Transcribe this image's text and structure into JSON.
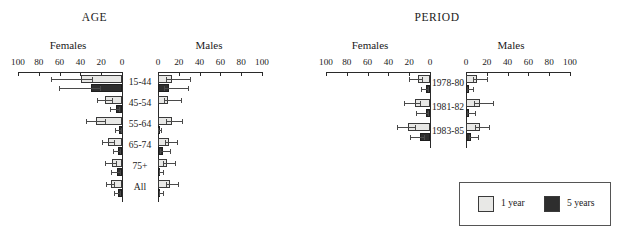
{
  "legend": {
    "entries": [
      {
        "label": "1 year",
        "color": "#e8e8e6",
        "key": "one_year"
      },
      {
        "label": "5 years",
        "color": "#2e2e2e",
        "key": "five_year"
      }
    ]
  },
  "axis": {
    "female_ticks": [
      "100",
      "80",
      "60",
      "40",
      "20",
      "0"
    ],
    "male_ticks": [
      "0",
      "20",
      "40",
      "60",
      "80",
      "100"
    ],
    "female_heading": "Females",
    "male_heading": "Males",
    "range": [
      0,
      100
    ]
  },
  "chart_data": [
    {
      "type": "bar",
      "title": "AGE",
      "xlabel": "",
      "ylabel": "",
      "xlim": [
        0,
        100
      ],
      "grid": false,
      "orientation": "horizontal-bidirectional",
      "legend_position": "outside-bottom-right",
      "categories": [
        "15-44",
        "45-54",
        "55-64",
        "65-74",
        "75+",
        "All"
      ],
      "panels": [
        {
          "name": "Females",
          "direction": "left",
          "series": [
            {
              "name": "1 year",
              "values": [
                39,
                16,
                25,
                13,
                10,
                11
              ],
              "ci_low": [
                29,
                10,
                16,
                8,
                6,
                8
              ],
              "ci_high": [
                68,
                24,
                35,
                19,
                16,
                15
              ]
            },
            {
              "name": "5 years",
              "values": [
                30,
                6,
                3,
                4,
                5,
                4
              ],
              "ci_low": [
                21,
                3,
                1,
                2,
                2,
                2
              ],
              "ci_high": [
                61,
                12,
                7,
                9,
                11,
                8
              ]
            }
          ]
        },
        {
          "name": "Males",
          "direction": "right",
          "series": [
            {
              "name": "1 year",
              "values": [
                13,
                10,
                13,
                11,
                9,
                12
              ],
              "ci_low": [
                8,
                6,
                8,
                7,
                5,
                8
              ],
              "ci_high": [
                31,
                22,
                23,
                18,
                16,
                19
              ]
            },
            {
              "name": "5 years",
              "values": [
                11,
                0,
                1,
                5,
                2,
                2
              ],
              "ci_low": [
                6,
                0,
                0,
                2,
                1,
                1
              ],
              "ci_high": [
                29,
                0,
                3,
                12,
                5,
                5
              ]
            }
          ]
        }
      ]
    },
    {
      "type": "bar",
      "title": "PERIOD",
      "xlabel": "",
      "ylabel": "",
      "xlim": [
        0,
        100
      ],
      "grid": false,
      "orientation": "horizontal-bidirectional",
      "legend_position": "outside-bottom-right",
      "categories": [
        "1978-80",
        "1981-82",
        "1983-85"
      ],
      "panels": [
        {
          "name": "Females",
          "direction": "left",
          "series": [
            {
              "name": "1 year",
              "values": [
                12,
                14,
                21
              ],
              "ci_low": [
                8,
                10,
                14
              ],
              "ci_high": [
                20,
                25,
                32
              ]
            },
            {
              "name": "5 years",
              "values": [
                4,
                4,
                10
              ],
              "ci_low": [
                2,
                2,
                6
              ],
              "ci_high": [
                9,
                13,
                19
              ]
            }
          ]
        },
        {
          "name": "Males",
          "direction": "right",
          "series": [
            {
              "name": "1 year",
              "values": [
                11,
                13,
                13
              ],
              "ci_low": [
                7,
                8,
                9
              ],
              "ci_high": [
                20,
                26,
                22
              ]
            },
            {
              "name": "5 years",
              "values": [
                3,
                3,
                5
              ],
              "ci_low": [
                1,
                1,
                3
              ],
              "ci_high": [
                7,
                9,
                12
              ]
            }
          ]
        }
      ]
    }
  ]
}
